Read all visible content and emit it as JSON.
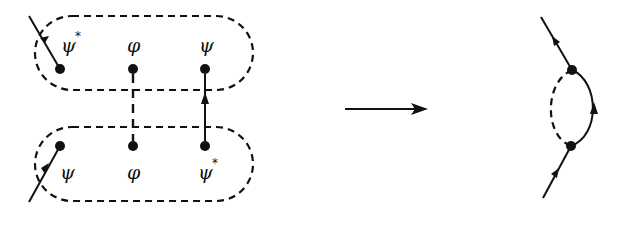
{
  "diagram": {
    "type": "feynman-diagram-contraction",
    "colors": {
      "ink": "#111111",
      "background": "#ffffff"
    },
    "left": {
      "top_group": {
        "fields": [
          {
            "symbol": "ψ",
            "superscript": "*",
            "external_line": "incoming-arrow-toward-top-left"
          },
          {
            "symbol": "φ",
            "superscript": ""
          },
          {
            "symbol": "ψ",
            "superscript": ""
          }
        ]
      },
      "bottom_group": {
        "fields": [
          {
            "symbol": "ψ",
            "superscript": "",
            "external_line": "incoming-arrow-from-bottom-left"
          },
          {
            "symbol": "φ",
            "superscript": ""
          },
          {
            "symbol": "ψ",
            "superscript": "*"
          }
        ]
      },
      "contractions": [
        {
          "from": "top.φ",
          "to": "bottom.φ",
          "style": "dashed"
        },
        {
          "from": "bottom.ψ*",
          "to": "top.ψ",
          "style": "solid-arrow-up"
        }
      ]
    },
    "transition_arrow": "→",
    "right": {
      "description": "one-loop self-energy: solid fermion arc (arrow upward) and dashed boson arc between two vertices, with external incoming and outgoing lines"
    }
  }
}
